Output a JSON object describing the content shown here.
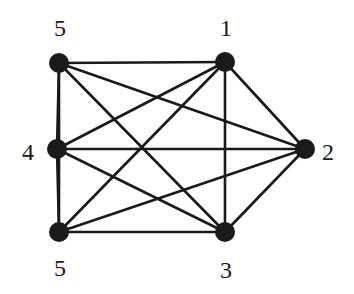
{
  "graph": {
    "type": "complete-graph",
    "nodes": [
      {
        "id": "tl",
        "label": "5",
        "x": 59,
        "y": 63,
        "lx": 60,
        "ly": 36,
        "anchor": "middle"
      },
      {
        "id": "tr",
        "label": "1",
        "x": 225,
        "y": 62,
        "lx": 226,
        "ly": 36,
        "anchor": "middle"
      },
      {
        "id": "r",
        "label": "2",
        "x": 305,
        "y": 149,
        "lx": 322,
        "ly": 160,
        "anchor": "start"
      },
      {
        "id": "ml",
        "label": "4",
        "x": 57,
        "y": 149,
        "lx": 34,
        "ly": 160,
        "anchor": "end"
      },
      {
        "id": "bl",
        "label": "5",
        "x": 59,
        "y": 232,
        "lx": 60,
        "ly": 276,
        "anchor": "middle"
      },
      {
        "id": "br",
        "label": "3",
        "x": 225,
        "y": 232,
        "lx": 226,
        "ly": 278,
        "anchor": "middle"
      }
    ],
    "edges": [
      [
        "tl",
        "tr"
      ],
      [
        "tl",
        "r"
      ],
      [
        "tl",
        "ml"
      ],
      [
        "tl",
        "bl"
      ],
      [
        "tl",
        "br"
      ],
      [
        "tr",
        "r"
      ],
      [
        "tr",
        "ml"
      ],
      [
        "tr",
        "bl"
      ],
      [
        "tr",
        "br"
      ],
      [
        "r",
        "ml"
      ],
      [
        "r",
        "bl"
      ],
      [
        "r",
        "br"
      ],
      [
        "ml",
        "bl"
      ],
      [
        "ml",
        "br"
      ],
      [
        "bl",
        "br"
      ]
    ],
    "node_radius": 10,
    "color": "#1a1a1a"
  }
}
